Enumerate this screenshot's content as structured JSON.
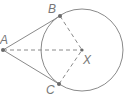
{
  "diagram": {
    "type": "geometry",
    "colors": {
      "stroke": "#8a8a8a",
      "point": "#6a6a6a",
      "label": "#777777"
    },
    "circle": {
      "center": "X",
      "cx": 82,
      "cy": 50,
      "r": 41
    },
    "points": [
      {
        "id": "A",
        "label": "A",
        "x": 3,
        "y": 50,
        "label_x": 0,
        "label_y": 44
      },
      {
        "id": "B",
        "label": "B",
        "x": 60,
        "y": 16,
        "label_x": 48,
        "label_y": 13
      },
      {
        "id": "C",
        "label": "C",
        "x": 59,
        "y": 84,
        "label_x": 46,
        "label_y": 94
      },
      {
        "id": "X",
        "label": "X",
        "x": 82,
        "y": 50,
        "label_x": 83,
        "label_y": 64
      }
    ],
    "segments": [
      {
        "from": "A",
        "to": "B",
        "style": "solid"
      },
      {
        "from": "A",
        "to": "C",
        "style": "solid"
      },
      {
        "from": "A",
        "to": "X",
        "style": "dashed"
      },
      {
        "from": "B",
        "to": "X",
        "style": "dashed"
      },
      {
        "from": "C",
        "to": "X",
        "style": "dashed"
      }
    ]
  }
}
